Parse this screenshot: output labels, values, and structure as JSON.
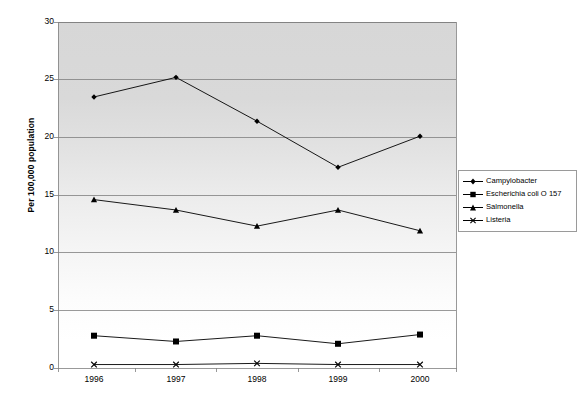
{
  "chart_data": {
    "type": "line",
    "title": "",
    "xlabel": "",
    "ylabel": "Per 100,000 population",
    "categories": [
      "1996",
      "1997",
      "1998",
      "1999",
      "2000"
    ],
    "x": [
      1996,
      1997,
      1998,
      1999,
      2000
    ],
    "ylim": [
      0,
      30
    ],
    "yticks": [
      0,
      5,
      10,
      15,
      20,
      25,
      30
    ],
    "ytick_labels": [
      "0",
      "5",
      "10",
      "15",
      "20",
      "25",
      "30"
    ],
    "grid": "horizontal",
    "legend_position": "right-outside",
    "series": [
      {
        "name": "Campylobacter",
        "marker": "diamond",
        "color": "#000000",
        "values": [
          23.5,
          25.2,
          21.4,
          17.4,
          20.1
        ]
      },
      {
        "name": "Escherichia coli O 157",
        "marker": "square",
        "color": "#000000",
        "values": [
          2.8,
          2.3,
          2.8,
          2.1,
          2.9
        ]
      },
      {
        "name": "Salmonella",
        "marker": "triangle",
        "color": "#000000",
        "values": [
          14.6,
          13.7,
          12.3,
          13.7,
          11.9
        ]
      },
      {
        "name": "Listeria",
        "marker": "cross",
        "color": "#000000",
        "values": [
          0.3,
          0.3,
          0.4,
          0.3,
          0.3
        ]
      }
    ]
  },
  "axis": {
    "y_title": "Per 100,000 population",
    "y_labels": [
      "30",
      "25",
      "20",
      "15",
      "10",
      "5",
      "0"
    ],
    "x_labels": [
      "1996",
      "1997",
      "1998",
      "1999",
      "2000"
    ]
  },
  "legend": {
    "items": [
      {
        "label": "Campylobacter",
        "marker": "diamond"
      },
      {
        "label": "Escherichia coli O 157",
        "marker": "square"
      },
      {
        "label": "Salmonella",
        "marker": "triangle"
      },
      {
        "label": "Listeria",
        "marker": "cross"
      }
    ]
  },
  "colors": {
    "line": "#000000",
    "grid": "#7f7f7f",
    "axis": "#7f7f7f",
    "plot_top": "#d7d7d7",
    "plot_bottom": "#ffffff",
    "legend_border": "#9a9a9a"
  }
}
